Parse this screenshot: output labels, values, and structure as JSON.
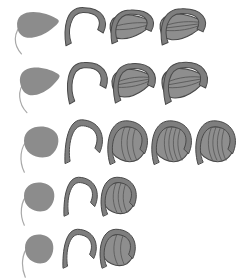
{
  "figure": {
    "background_color": "#ffffff",
    "width": 250,
    "height": 278,
    "palette": {
      "fill_light": "#9a9a9a",
      "fill_mid": "#8c8c8c",
      "fill_dark": "#7e7e7e",
      "outline": "#4a4a4a",
      "outline_soft": "#5a5a5a",
      "vein": "#555555",
      "tail": "#a8a8a8"
    },
    "row_count": 5,
    "rows": [
      {
        "index": 1,
        "label": "row-1",
        "y_center": 25,
        "stage_count": 4,
        "stages": [
          {
            "index": 1,
            "label": "stage-1-1",
            "kind": "solid-pod",
            "cx": 38,
            "cy": 24,
            "rx": 21,
            "ry": 14,
            "rotation": -8,
            "fill": "#8c8c8c",
            "has_outline": false,
            "has_hook": false,
            "has_tail": true,
            "veins": 0
          },
          {
            "index": 2,
            "label": "stage-1-2",
            "kind": "hook-only",
            "cx": 84,
            "cy": 26,
            "rx": 20,
            "ry": 15,
            "rotation": -6,
            "fill": "#8a8a8a",
            "has_outline": true,
            "has_hook": true,
            "has_tail": false,
            "veins": 0
          },
          {
            "index": 3,
            "label": "stage-1-3",
            "kind": "pod-with-hook",
            "cx": 131,
            "cy": 26,
            "rx": 21,
            "ry": 13,
            "rotation": -7,
            "fill": "#8e8e8e",
            "has_outline": true,
            "has_hook": true,
            "has_tail": false,
            "veins": 2
          },
          {
            "index": 4,
            "label": "stage-1-4",
            "kind": "pod-with-hook",
            "cx": 182,
            "cy": 26,
            "rx": 22,
            "ry": 14,
            "rotation": -7,
            "fill": "#8e8e8e",
            "has_outline": true,
            "has_hook": true,
            "has_tail": false,
            "veins": 3
          }
        ]
      },
      {
        "index": 2,
        "label": "row-2",
        "y_center": 80,
        "stage_count": 4,
        "stages": [
          {
            "index": 1,
            "label": "stage-2-1",
            "kind": "solid-pod",
            "cx": 40,
            "cy": 80,
            "rx": 20,
            "ry": 15,
            "rotation": -12,
            "fill": "#8c8c8c",
            "has_outline": false,
            "has_hook": false,
            "has_tail": true,
            "veins": 0
          },
          {
            "index": 2,
            "label": "stage-2-2",
            "kind": "hook-only",
            "cx": 86,
            "cy": 82,
            "rx": 20,
            "ry": 16,
            "rotation": -10,
            "fill": "#8a8a8a",
            "has_outline": true,
            "has_hook": true,
            "has_tail": false,
            "veins": 0
          },
          {
            "index": 3,
            "label": "stage-2-3",
            "kind": "pod-with-hook",
            "cx": 133,
            "cy": 82,
            "rx": 21,
            "ry": 15,
            "rotation": -10,
            "fill": "#8e8e8e",
            "has_outline": true,
            "has_hook": true,
            "has_tail": false,
            "veins": 3
          },
          {
            "index": 4,
            "label": "stage-2-4",
            "kind": "pod-with-hook",
            "cx": 184,
            "cy": 82,
            "rx": 22,
            "ry": 16,
            "rotation": -10,
            "fill": "#8e8e8e",
            "has_outline": true,
            "has_hook": true,
            "has_tail": false,
            "veins": 3
          }
        ]
      },
      {
        "index": 3,
        "label": "row-3",
        "y_center": 140,
        "stage_count": 5,
        "stages": [
          {
            "index": 1,
            "label": "stage-3-1",
            "kind": "solid-round",
            "cx": 41,
            "cy": 141,
            "rx": 17,
            "ry": 16,
            "rotation": 0,
            "fill": "#8c8c8c",
            "has_outline": false,
            "has_hook": false,
            "has_tail": true,
            "veins": 0
          },
          {
            "index": 2,
            "label": "stage-3-2",
            "kind": "hook-only",
            "cx": 83,
            "cy": 142,
            "rx": 18,
            "ry": 18,
            "rotation": 0,
            "fill": "#8a8a8a",
            "has_outline": true,
            "has_hook": true,
            "has_tail": false,
            "veins": 0
          },
          {
            "index": 3,
            "label": "stage-3-3",
            "kind": "coiled-pod",
            "cx": 128,
            "cy": 143,
            "rx": 18,
            "ry": 18,
            "rotation": 0,
            "fill": "#8e8e8e",
            "has_outline": true,
            "has_hook": true,
            "has_tail": false,
            "veins": 3
          },
          {
            "index": 4,
            "label": "stage-3-4",
            "kind": "coiled-pod",
            "cx": 172,
            "cy": 143,
            "rx": 18,
            "ry": 18,
            "rotation": 0,
            "fill": "#8e8e8e",
            "has_outline": true,
            "has_hook": true,
            "has_tail": false,
            "veins": 4
          },
          {
            "index": 5,
            "label": "stage-3-5",
            "kind": "coiled-pod",
            "cx": 216,
            "cy": 143,
            "rx": 18,
            "ry": 18,
            "rotation": 0,
            "fill": "#8e8e8e",
            "has_outline": true,
            "has_hook": true,
            "has_tail": false,
            "veins": 4
          }
        ]
      },
      {
        "index": 4,
        "label": "row-4",
        "y_center": 196,
        "stage_count": 3,
        "stages": [
          {
            "index": 1,
            "label": "stage-4-1",
            "kind": "solid-round",
            "cx": 39,
            "cy": 196,
            "rx": 15,
            "ry": 15,
            "rotation": 0,
            "fill": "#8c8c8c",
            "has_outline": false,
            "has_hook": false,
            "has_tail": true,
            "veins": 0
          },
          {
            "index": 2,
            "label": "stage-4-2",
            "kind": "hook-only",
            "cx": 80,
            "cy": 197,
            "rx": 16,
            "ry": 16,
            "rotation": 0,
            "fill": "#8a8a8a",
            "has_outline": true,
            "has_hook": true,
            "has_tail": false,
            "veins": 0
          },
          {
            "index": 3,
            "label": "stage-4-3",
            "kind": "coiled-pod",
            "cx": 119,
            "cy": 197,
            "rx": 16,
            "ry": 16,
            "rotation": 0,
            "fill": "#8e8e8e",
            "has_outline": true,
            "has_hook": true,
            "has_tail": false,
            "veins": 3
          }
        ]
      },
      {
        "index": 5,
        "label": "row-5",
        "y_center": 248,
        "stage_count": 3,
        "stages": [
          {
            "index": 1,
            "label": "stage-5-1",
            "kind": "solid-round",
            "cx": 39,
            "cy": 248,
            "rx": 14,
            "ry": 15,
            "rotation": 0,
            "fill": "#8c8c8c",
            "has_outline": false,
            "has_hook": false,
            "has_tail": true,
            "veins": 0
          },
          {
            "index": 2,
            "label": "stage-5-2",
            "kind": "hook-only",
            "cx": 79,
            "cy": 249,
            "rx": 16,
            "ry": 16,
            "rotation": 0,
            "fill": "#8a8a8a",
            "has_outline": true,
            "has_hook": true,
            "has_tail": false,
            "veins": 0
          },
          {
            "index": 3,
            "label": "stage-5-3",
            "kind": "coiled-pod",
            "cx": 118,
            "cy": 249,
            "rx": 16,
            "ry": 16,
            "rotation": 0,
            "fill": "#8e8e8e",
            "has_outline": true,
            "has_hook": true,
            "has_tail": false,
            "veins": 2
          }
        ]
      }
    ]
  }
}
